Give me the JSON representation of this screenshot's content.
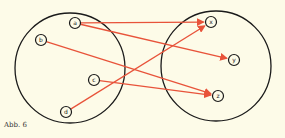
{
  "caption": "Abb. 6",
  "colors": {
    "background": "#fdfbe8",
    "set_outline": "#1a1a1a",
    "arrow": "#e8533a"
  },
  "sets": [
    {
      "name": "domain",
      "cx": 70,
      "cy": 68,
      "r": 55
    },
    {
      "name": "codomain",
      "cx": 216,
      "cy": 66,
      "r": 55
    }
  ],
  "nodes": [
    {
      "id": "a",
      "label": "a",
      "x": 75,
      "y": 23
    },
    {
      "id": "b",
      "label": "b",
      "x": 41,
      "y": 40
    },
    {
      "id": "c",
      "label": "c",
      "x": 94,
      "y": 80
    },
    {
      "id": "d",
      "label": "d",
      "x": 66,
      "y": 112
    },
    {
      "id": "x",
      "label": "x",
      "x": 211,
      "y": 22
    },
    {
      "id": "y",
      "label": "y",
      "x": 234,
      "y": 60
    },
    {
      "id": "z",
      "label": "z",
      "x": 218,
      "y": 96
    }
  ],
  "arrows": [
    {
      "from": "a",
      "to": "x"
    },
    {
      "from": "a",
      "to": "y"
    },
    {
      "from": "b",
      "to": "z"
    },
    {
      "from": "c",
      "to": "z"
    },
    {
      "from": "d",
      "to": "x"
    }
  ]
}
